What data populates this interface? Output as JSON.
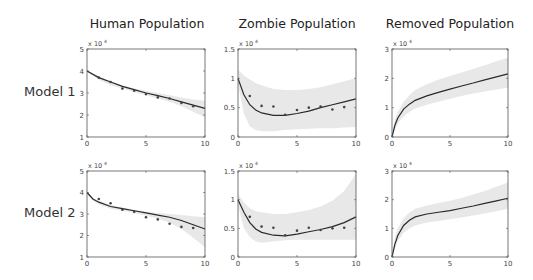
{
  "column_titles": [
    "Human Population",
    "Zombie Population",
    "Removed Population"
  ],
  "row_labels": [
    "Model 1",
    "Model 2"
  ],
  "colors": {
    "line": "#2a2a2a",
    "band": "#e8e8e8",
    "points": "#444444",
    "axis": "#555555",
    "tick_text": "#444444"
  },
  "chart_data": [
    {
      "type": "line",
      "title": "Human Population",
      "row": "Model 1",
      "xlabel": "",
      "ylabel": "",
      "xlim": [
        0,
        10
      ],
      "ylim": [
        1,
        5
      ],
      "yscale_label": "x 10^4",
      "xticks": [
        0,
        5,
        10
      ],
      "yticks": [
        1,
        2,
        3,
        4,
        5
      ],
      "grid": false,
      "fit": {
        "x": [
          0,
          1,
          2,
          3,
          4,
          5,
          6,
          7,
          8,
          9,
          10
        ],
        "y": [
          4.0,
          3.7,
          3.5,
          3.3,
          3.15,
          3.0,
          2.88,
          2.75,
          2.6,
          2.45,
          2.3
        ]
      },
      "band_lower": [
        3.95,
        3.6,
        3.35,
        3.2,
        3.05,
        2.9,
        2.75,
        2.6,
        2.4,
        2.15,
        1.9
      ],
      "band_upper": [
        4.05,
        3.75,
        3.55,
        3.35,
        3.2,
        3.1,
        3.0,
        2.9,
        2.8,
        2.7,
        2.65
      ],
      "observed": {
        "x": [
          1,
          2,
          3,
          4,
          5,
          6,
          7,
          8,
          9
        ],
        "y": [
          3.7,
          3.5,
          3.2,
          3.1,
          2.95,
          2.8,
          2.75,
          2.55,
          2.4
        ]
      }
    },
    {
      "type": "line",
      "title": "Zombie Population",
      "row": "Model 1",
      "xlim": [
        0,
        10
      ],
      "ylim": [
        0,
        1.5
      ],
      "yscale_label": "x 10^4",
      "xticks": [
        0,
        5,
        10
      ],
      "yticks": [
        0,
        0.5,
        1,
        1.5
      ],
      "grid": false,
      "fit": {
        "x": [
          0,
          0.5,
          1,
          1.5,
          2,
          3,
          4,
          5,
          6,
          7,
          8,
          9,
          10
        ],
        "y": [
          1.0,
          0.72,
          0.55,
          0.46,
          0.41,
          0.37,
          0.37,
          0.4,
          0.44,
          0.5,
          0.55,
          0.6,
          0.65
        ]
      },
      "band_lower": [
        0.9,
        0.4,
        0.18,
        0.12,
        0.1,
        0.1,
        0.12,
        0.13,
        0.14,
        0.15,
        0.15,
        0.16,
        0.17
      ],
      "band_upper": [
        1.15,
        1.05,
        0.98,
        0.92,
        0.88,
        0.82,
        0.8,
        0.8,
        0.82,
        0.85,
        0.9,
        0.95,
        1.0
      ],
      "observed": {
        "x": [
          1,
          2,
          3,
          4,
          5,
          6,
          7,
          8,
          9
        ],
        "y": [
          0.7,
          0.53,
          0.52,
          0.38,
          0.46,
          0.5,
          0.52,
          0.47,
          0.51
        ]
      }
    },
    {
      "type": "line",
      "title": "Removed Population",
      "row": "Model 1",
      "xlim": [
        0,
        10
      ],
      "ylim": [
        0,
        3
      ],
      "yscale_label": "x 10^4",
      "xticks": [
        0,
        5,
        10
      ],
      "yticks": [
        0,
        1,
        2,
        3
      ],
      "grid": false,
      "fit": {
        "x": [
          0,
          0.25,
          0.5,
          1,
          1.5,
          2,
          3,
          4,
          5,
          6,
          7,
          8,
          9,
          10
        ],
        "y": [
          0,
          0.4,
          0.65,
          0.95,
          1.12,
          1.25,
          1.4,
          1.52,
          1.63,
          1.74,
          1.84,
          1.95,
          2.05,
          2.15
        ]
      },
      "band_lower": [
        0,
        0.25,
        0.45,
        0.7,
        0.85,
        0.97,
        1.1,
        1.2,
        1.3,
        1.4,
        1.48,
        1.55,
        1.62,
        1.68
      ],
      "band_upper": [
        0.05,
        0.6,
        0.85,
        1.2,
        1.42,
        1.6,
        1.8,
        1.95,
        2.08,
        2.2,
        2.32,
        2.45,
        2.58,
        2.7
      ],
      "observed": {
        "x": [],
        "y": []
      }
    },
    {
      "type": "line",
      "title": "Human Population",
      "row": "Model 2",
      "xlim": [
        0,
        10
      ],
      "ylim": [
        1,
        5
      ],
      "yscale_label": "x 10^4",
      "xticks": [
        0,
        5,
        10
      ],
      "yticks": [
        1,
        2,
        3,
        4,
        5
      ],
      "grid": false,
      "fit": {
        "x": [
          0,
          0.5,
          1,
          2,
          3,
          4,
          5,
          6,
          7,
          8,
          9,
          10
        ],
        "y": [
          4.0,
          3.7,
          3.55,
          3.35,
          3.25,
          3.15,
          3.05,
          2.95,
          2.85,
          2.7,
          2.5,
          2.3
        ]
      },
      "band_lower": [
        3.95,
        3.6,
        3.45,
        3.25,
        3.15,
        3.05,
        2.92,
        2.78,
        2.6,
        2.3,
        1.9,
        1.45
      ],
      "band_upper": [
        4.05,
        3.75,
        3.6,
        3.42,
        3.3,
        3.2,
        3.12,
        3.05,
        3.0,
        2.95,
        2.9,
        2.85
      ],
      "observed": {
        "x": [
          1,
          2,
          3,
          4,
          5,
          6,
          7,
          8,
          9
        ],
        "y": [
          3.7,
          3.5,
          3.2,
          3.1,
          2.85,
          2.75,
          2.55,
          2.4,
          2.35
        ]
      }
    },
    {
      "type": "line",
      "title": "Zombie Population",
      "row": "Model 2",
      "xlim": [
        0,
        10
      ],
      "ylim": [
        0,
        1.5
      ],
      "yscale_label": "x 10^4",
      "xticks": [
        0,
        5,
        10
      ],
      "yticks": [
        0,
        0.5,
        1,
        1.5
      ],
      "grid": false,
      "fit": {
        "x": [
          0,
          0.5,
          1,
          1.5,
          2,
          3,
          4,
          5,
          6,
          7,
          8,
          9,
          10
        ],
        "y": [
          1.0,
          0.78,
          0.6,
          0.49,
          0.43,
          0.38,
          0.37,
          0.4,
          0.44,
          0.48,
          0.53,
          0.6,
          0.7
        ]
      },
      "band_lower": [
        0.9,
        0.5,
        0.35,
        0.27,
        0.25,
        0.27,
        0.29,
        0.3,
        0.3,
        0.3,
        0.3,
        0.3,
        0.3
      ],
      "band_upper": [
        1.1,
        0.95,
        0.85,
        0.8,
        0.78,
        0.75,
        0.75,
        0.78,
        0.82,
        0.88,
        0.98,
        1.15,
        1.45
      ],
      "observed": {
        "x": [
          1,
          2,
          3,
          4,
          5,
          6,
          7,
          8,
          9
        ],
        "y": [
          0.7,
          0.53,
          0.51,
          0.38,
          0.46,
          0.51,
          0.47,
          0.5,
          0.51
        ]
      }
    },
    {
      "type": "line",
      "title": "Removed Population",
      "row": "Model 2",
      "xlim": [
        0,
        10
      ],
      "ylim": [
        0,
        3
      ],
      "yscale_label": "x 10^4",
      "xticks": [
        0,
        5,
        10
      ],
      "yticks": [
        0,
        1,
        2,
        3
      ],
      "grid": false,
      "fit": {
        "x": [
          0,
          0.25,
          0.5,
          1,
          1.5,
          2,
          3,
          4,
          5,
          6,
          7,
          8,
          9,
          10
        ],
        "y": [
          0,
          0.45,
          0.75,
          1.1,
          1.28,
          1.4,
          1.5,
          1.56,
          1.62,
          1.7,
          1.78,
          1.87,
          1.96,
          2.05
        ]
      },
      "band_lower": [
        0,
        0.3,
        0.55,
        0.85,
        1.0,
        1.1,
        1.2,
        1.26,
        1.32,
        1.38,
        1.45,
        1.52,
        1.6,
        1.68
      ],
      "band_upper": [
        0.05,
        0.7,
        1.0,
        1.35,
        1.55,
        1.68,
        1.8,
        1.88,
        1.96,
        2.06,
        2.18,
        2.3,
        2.45,
        2.6
      ],
      "observed": {
        "x": [],
        "y": []
      }
    }
  ]
}
